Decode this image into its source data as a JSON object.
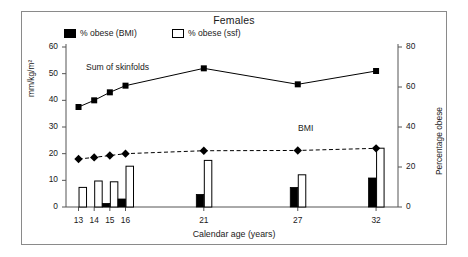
{
  "chart_data": {
    "type": "line",
    "title": "Females",
    "xlabel": "Calendar age (years)",
    "ylabel": "mm/kg/m²",
    "ylabel_right": "Percentage obese",
    "x": [
      13,
      14,
      15,
      16,
      21,
      27,
      32
    ],
    "xticklabels": [
      "13",
      "14",
      "15",
      "16",
      "21",
      "27",
      "32"
    ],
    "ylim": [
      0,
      60
    ],
    "yticks": [
      0,
      10,
      20,
      30,
      40,
      50,
      60
    ],
    "yticklabels": [
      "0",
      "10",
      "20",
      "30",
      "40",
      "50",
      "60"
    ],
    "ylim_right": [
      0,
      80
    ],
    "yticks_right": [
      0,
      20,
      40,
      60,
      80
    ],
    "yticklabels_right": [
      "0",
      "20",
      "40",
      "60",
      "80"
    ],
    "grid": false,
    "legend_position": "top-left",
    "series": [
      {
        "name": "Sum of skinfolds",
        "type": "line",
        "marker": "square",
        "linestyle": "solid",
        "axis": "left",
        "color": "#000000",
        "values": [
          37.5,
          40.0,
          43.0,
          45.5,
          52.0,
          46.0,
          51.0
        ]
      },
      {
        "name": "BMI",
        "type": "line",
        "marker": "diamond",
        "linestyle": "dashed",
        "axis": "left",
        "color": "#000000",
        "values": [
          18.0,
          18.6,
          19.3,
          20.0,
          21.1,
          21.2,
          22.0
        ]
      },
      {
        "name": "% obese (BMI)",
        "type": "bar",
        "fill": "solid-black",
        "axis": "right",
        "color": "#000000",
        "values": [
          0,
          0,
          1.8,
          4.0,
          6.3,
          9.8,
          14.5
        ]
      },
      {
        "name": "% obese (ssf)",
        "type": "bar",
        "fill": "open-white",
        "axis": "right",
        "color": "#ffffff",
        "values": [
          9.8,
          13.0,
          12.6,
          20.4,
          23.3,
          16.1,
          29.4
        ]
      }
    ],
    "annotations": [
      {
        "text": "Sum of skinfolds",
        "x": 14.0,
        "y": 50.0
      },
      {
        "text": "BMI",
        "x": 25.0,
        "y": 30.0
      }
    ]
  },
  "legend": {
    "items": [
      {
        "label": "% obese (BMI)",
        "swatch": "filled-square"
      },
      {
        "label": "% obese (ssf)",
        "swatch": "open-square"
      }
    ]
  },
  "colors": {
    "frame": "#8a8a8a",
    "axis": "#555555",
    "ink": "#1a1a1a",
    "series": "#000000"
  }
}
